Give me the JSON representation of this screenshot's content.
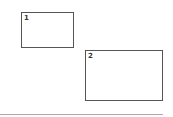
{
  "boxes": [
    {
      "label": "1"
    },
    {
      "label": "2"
    }
  ]
}
